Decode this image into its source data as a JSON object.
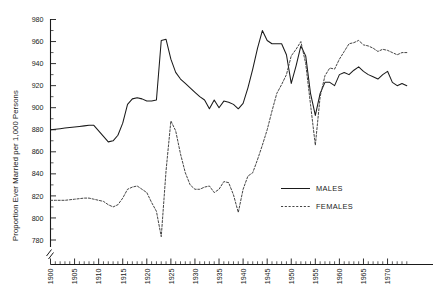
{
  "chart_data": {
    "type": "line",
    "title": "",
    "subtitle": "",
    "xlabel": "",
    "ylabel": "Proportion Ever Married per 1,000 Persons",
    "xlim": [
      1900,
      1974
    ],
    "ylim": [
      775,
      983
    ],
    "yticks": [
      780,
      800,
      820,
      840,
      860,
      880,
      900,
      920,
      940,
      960,
      980
    ],
    "ytick_labels": [
      "780",
      "800",
      "820",
      "840",
      "860",
      "880",
      "900",
      "920",
      "940",
      "960",
      "980"
    ],
    "xticks": [
      1900,
      1905,
      1910,
      1915,
      1920,
      1925,
      1930,
      1935,
      1940,
      1945,
      1950,
      1955,
      1960,
      1965,
      1970
    ],
    "xtick_labels": [
      "1900",
      "1905",
      "1910",
      "1915",
      "1920",
      "1925",
      "1930",
      "1935",
      "1940",
      "1945",
      "1950",
      "1955",
      "1960",
      "1965",
      "1970"
    ],
    "x_minor_tick_step": 1,
    "y_axis_break": true,
    "grid": false,
    "legend_position": "center-right",
    "legend_entries": [
      "MALES",
      "FEMALES"
    ],
    "colors": {
      "males": "#1a1a1a",
      "females": "#3a3a3a",
      "axis": "#1a1a1a",
      "background": "#ffffff"
    },
    "x": [
      1900,
      1901,
      1902,
      1903,
      1904,
      1905,
      1906,
      1907,
      1908,
      1909,
      1910,
      1911,
      1912,
      1913,
      1914,
      1915,
      1916,
      1917,
      1918,
      1919,
      1920,
      1921,
      1922,
      1923,
      1924,
      1925,
      1926,
      1927,
      1928,
      1929,
      1930,
      1931,
      1932,
      1933,
      1934,
      1935,
      1936,
      1937,
      1938,
      1939,
      1940,
      1941,
      1942,
      1943,
      1944,
      1945,
      1946,
      1947,
      1948,
      1949,
      1950,
      1951,
      1952,
      1953,
      1954,
      1955,
      1956,
      1957,
      1958,
      1959,
      1960,
      1961,
      1962,
      1963,
      1964,
      1965,
      1966,
      1967,
      1968,
      1969,
      1970,
      1971,
      1972,
      1973,
      1974
    ],
    "series": [
      {
        "name": "MALES",
        "style": "solid",
        "values": [
          880,
          880.5,
          881,
          881.5,
          882,
          882.5,
          883,
          883.5,
          884,
          884,
          879,
          874,
          869,
          870,
          875,
          886,
          903,
          908,
          909,
          908,
          906,
          906,
          907,
          961,
          962,
          944,
          932,
          926,
          922,
          918,
          914,
          910,
          907,
          899,
          907,
          900,
          906,
          905,
          903,
          899,
          904,
          918,
          935,
          954,
          970,
          961,
          958,
          958,
          958,
          948,
          922,
          938,
          956,
          947,
          913,
          893,
          913,
          923,
          923,
          920,
          930,
          932,
          930,
          934,
          937,
          933,
          930,
          928,
          926,
          930,
          933,
          923,
          920,
          922,
          920
        ]
      },
      {
        "name": "FEMALES",
        "style": "dashed",
        "values": [
          816,
          816,
          816,
          816,
          816.5,
          817,
          817.5,
          818,
          818,
          817,
          816,
          815,
          812,
          810,
          812,
          818,
          826,
          828,
          829,
          826,
          823,
          814,
          806,
          783,
          843,
          888,
          879,
          858,
          841,
          830,
          826,
          826,
          828,
          829,
          823,
          826,
          833,
          832,
          821,
          805,
          826,
          838,
          841,
          853,
          866,
          880,
          897,
          913,
          921,
          930,
          947,
          953,
          960,
          940,
          903,
          866,
          910,
          929,
          936,
          935,
          944,
          951,
          958,
          959,
          961,
          957,
          956,
          954,
          951,
          953,
          952,
          950,
          948,
          950,
          950
        ]
      }
    ]
  },
  "legend": {
    "males_label": "MALES",
    "females_label": "FEMALES"
  },
  "axes": {
    "y_title": "Proportion Ever Married per 1,000 Persons"
  }
}
